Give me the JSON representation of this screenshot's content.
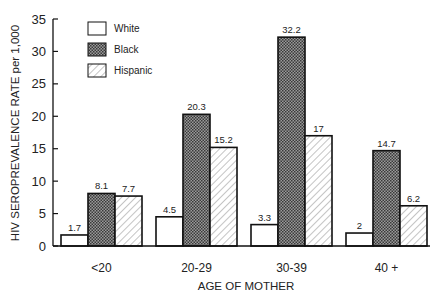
{
  "chart_data": {
    "type": "bar",
    "title": "",
    "xlabel": "AGE OF MOTHER",
    "ylabel": "HIV SEROPREVALENCE RATE per 1,000",
    "ylim": [
      0,
      35
    ],
    "yticks": [
      0,
      5,
      10,
      15,
      20,
      25,
      30,
      35
    ],
    "grid": false,
    "legend_position": "upper-left",
    "categories": [
      "<20",
      "20-29",
      "30-39",
      "40 +"
    ],
    "series": [
      {
        "name": "White",
        "pattern": "none",
        "values": [
          1.7,
          4.5,
          3.3,
          2
        ]
      },
      {
        "name": "Black",
        "pattern": "crosshatch-dense",
        "values": [
          8.1,
          20.3,
          32.2,
          14.7
        ]
      },
      {
        "name": "Hispanic",
        "pattern": "diagonal-hatch",
        "values": [
          7.7,
          15.2,
          17,
          6.2
        ]
      }
    ],
    "value_labels": [
      [
        "1.7",
        "8.1",
        "7.7"
      ],
      [
        "4.5",
        "20.3",
        "15.2"
      ],
      [
        "3.3",
        "32.2",
        "17"
      ],
      [
        "2",
        "14.7",
        "6.2"
      ]
    ]
  },
  "colors": {
    "stroke": "#111111",
    "black_fill": "#6a6a6a",
    "hatch": "#8a8a8a",
    "background": "#ffffff"
  }
}
